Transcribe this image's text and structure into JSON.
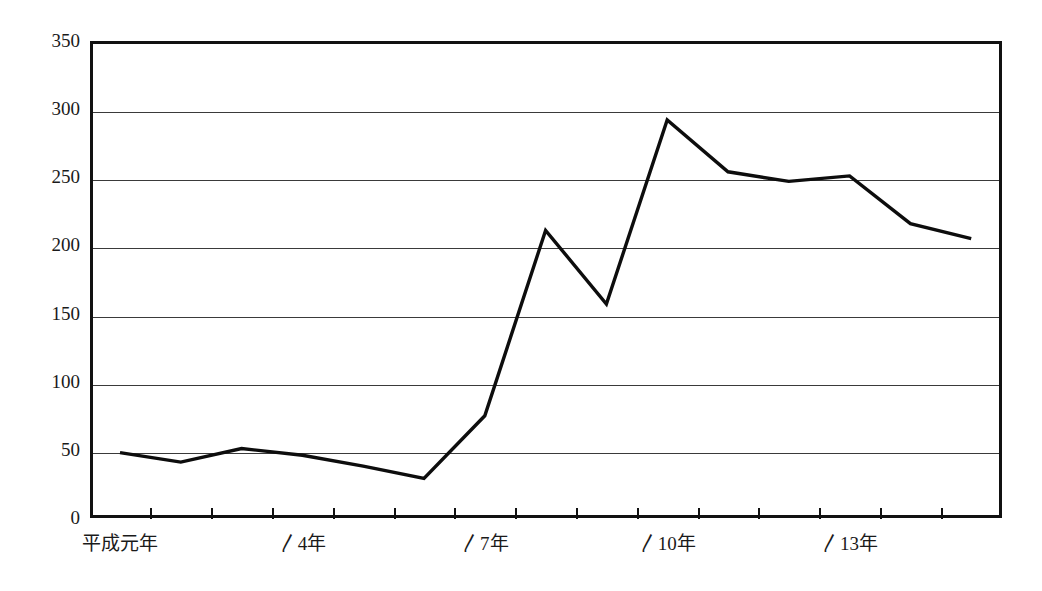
{
  "chart_data": {
    "type": "line",
    "title": "",
    "xlabel": "",
    "ylabel": "",
    "ylim": [
      0,
      350
    ],
    "ytick_values": [
      0,
      50,
      100,
      150,
      200,
      250,
      300,
      350
    ],
    "ytick_labels": [
      "0",
      "50",
      "100",
      "150",
      "200",
      "250",
      "300",
      "350"
    ],
    "grid": true,
    "legend": "none",
    "categories": [
      "平成元年",
      "　2年",
      "　3年",
      "〳4年",
      "　5年",
      "　6年",
      "〳7年",
      "　8年",
      "　9年",
      "〳10年",
      "　11年",
      "　12年",
      "〳13年",
      "　14年",
      "　15年"
    ],
    "visible_xtick_labels": [
      {
        "index": 0,
        "text": "平成元年"
      },
      {
        "index": 3,
        "text": "〳4年"
      },
      {
        "index": 6,
        "text": "〳7年"
      },
      {
        "index": 9,
        "text": "〳10年"
      },
      {
        "index": 12,
        "text": "〳13年"
      }
    ],
    "values": [
      48,
      41,
      51,
      46,
      38,
      29,
      75,
      211,
      157,
      292,
      254,
      247,
      251,
      216,
      205
    ],
    "series": [
      {
        "name": "",
        "color": "#0d0d0d",
        "values": [
          48,
          41,
          51,
          46,
          38,
          29,
          75,
          211,
          157,
          292,
          254,
          247,
          251,
          216,
          205
        ]
      }
    ]
  },
  "colors": {
    "line": "#0d0d0d",
    "axis": "#111111",
    "grid": "#3a3a3a",
    "background": "#ffffff",
    "text": "#1a1a1a"
  }
}
